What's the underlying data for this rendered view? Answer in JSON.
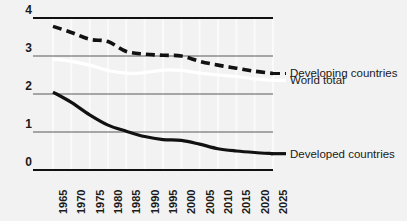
{
  "chart_data": {
    "type": "line",
    "title": "",
    "subtitle": "",
    "xlabel": "",
    "ylabel": "",
    "xlim": [
      1965,
      2025
    ],
    "ylim": [
      0,
      4
    ],
    "yticks": [
      0,
      1,
      2,
      3,
      4
    ],
    "ytick_labels": [
      "0",
      "1",
      "2",
      "3",
      "4"
    ],
    "grid": "horizontal-solid-and-vertical-light",
    "legend_position": "right-inline",
    "x": [
      1965,
      1970,
      1975,
      1980,
      1985,
      1990,
      1995,
      2000,
      2005,
      2010,
      2015,
      2020,
      2025
    ],
    "xtick_labels": [
      "1965",
      "1970",
      "1975",
      "1980",
      "1985",
      "1990",
      "1995",
      "2000",
      "2005",
      "2010",
      "2015",
      "2020",
      "2025"
    ],
    "series": [
      {
        "name": "Developing countries",
        "style": "dashed",
        "color": "#111111",
        "values": [
          3.78,
          3.62,
          3.44,
          3.38,
          3.12,
          3.05,
          3.02,
          3.0,
          2.86,
          2.76,
          2.68,
          2.6,
          2.54
        ]
      },
      {
        "name": "World total",
        "style": "solid",
        "color": "#ffffff",
        "values": [
          2.92,
          2.86,
          2.76,
          2.62,
          2.55,
          2.56,
          2.63,
          2.62,
          2.55,
          2.5,
          2.46,
          2.4,
          2.36
        ]
      },
      {
        "name": "Developed countries",
        "style": "solid",
        "color": "#111111",
        "values": [
          2.05,
          1.78,
          1.45,
          1.18,
          1.02,
          0.88,
          0.8,
          0.78,
          0.68,
          0.56,
          0.5,
          0.46,
          0.43
        ]
      }
    ],
    "legend": [
      {
        "label": "Developing countries",
        "style": "dashed",
        "color": "#111111"
      },
      {
        "label": "World total",
        "style": "solid",
        "color": "#ffffff"
      },
      {
        "label": "Developed countries",
        "style": "solid",
        "color": "#111111"
      }
    ],
    "colors": {
      "background": "#f2f2f2",
      "gridline": "#595959",
      "vertical_gridline": "#fafafa",
      "axis": "#111111"
    }
  }
}
